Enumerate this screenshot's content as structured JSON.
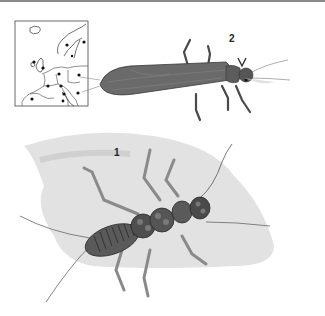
{
  "plate": {
    "description": "Stonefly illustration plate with European distribution map",
    "figures": [
      {
        "label": "1",
        "subject": "stonefly nymph (larva), dorsal view on grey wash background"
      },
      {
        "label": "2",
        "subject": "adult stonefly, dorsal view with folded wings"
      }
    ],
    "map": {
      "region": "Europe",
      "marker": "black dot",
      "marker_count": 13
    }
  },
  "colors": {
    "background": "#ffffff",
    "ink": "#2a2a2a",
    "wash": "#d4d4d4",
    "adult_body": "#5a5a5a",
    "nymph_body": "#4a4a4a",
    "top_rule": "#8a8a8a"
  }
}
